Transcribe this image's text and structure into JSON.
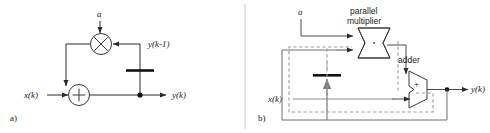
{
  "figure": {
    "panels": [
      {
        "id": "a",
        "caption": "a)",
        "type": "signal-flow-graph",
        "labels": {
          "coefficient": "a",
          "input": "x(k)",
          "output": "y(k)",
          "delayed_output": "y(k-1)"
        },
        "nodes": [
          {
            "name": "multiplier",
            "symbol": "×",
            "shape": "circle"
          },
          {
            "name": "adder",
            "symbol": "+",
            "shape": "circle"
          },
          {
            "name": "delay",
            "symbol": "",
            "shape": "thick-bar"
          },
          {
            "name": "output-tap",
            "symbol": "",
            "shape": "dot"
          }
        ]
      },
      {
        "id": "b",
        "caption": "b)",
        "type": "hardware-block-diagram",
        "labels": {
          "coefficient": "a",
          "input": "x(k)",
          "output": "y(k)",
          "multiplier": "parallel\nmultiplier",
          "multiplier_line1": "parallel",
          "multiplier_line2": "multiplier",
          "adder": "adder",
          "adder_sign": "+"
        },
        "nodes": [
          {
            "name": "parallel-multiplier",
            "shape": "bowtie"
          },
          {
            "name": "adder",
            "shape": "alu-trapezoid"
          },
          {
            "name": "delay-register",
            "shape": "thick-bar"
          },
          {
            "name": "output-tap",
            "shape": "dot"
          }
        ]
      }
    ],
    "colors": {
      "line": "#2b2b2b",
      "line_gray": "#8c8c8c",
      "dashed": "#8c8c8c",
      "thick_bar": "#111111",
      "background": "#ffffff",
      "divider": "#c9c9c9"
    }
  }
}
